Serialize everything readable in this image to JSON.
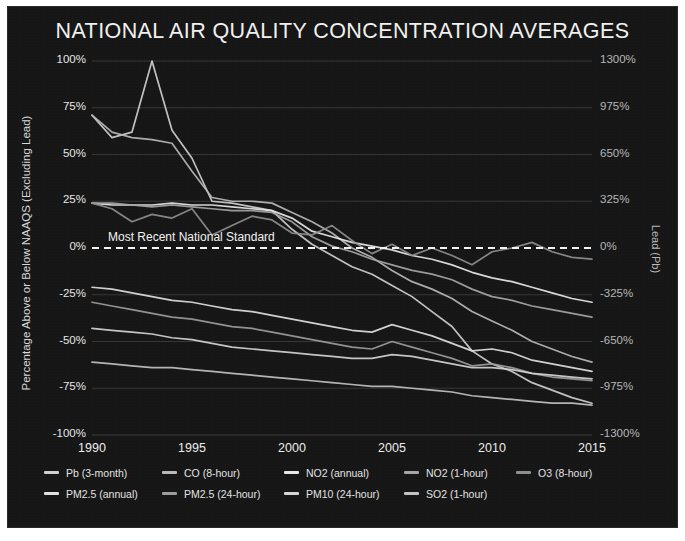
{
  "chart_card": {
    "background": "#161616",
    "border": "#ffffff"
  },
  "header": {
    "title": "NATIONAL AIR QUALITY CONCENTRATION AVERAGES"
  },
  "annotations": {
    "standard_line_label": "Most Recent National Standard"
  },
  "chart_data": {
    "type": "line",
    "title": "NATIONAL AIR QUALITY CONCENTRATION AVERAGES",
    "xlabel": "",
    "ylabel": "Percentage Above or Below NAAQS (Excluding Lead)",
    "y2label": "Lead (Pb)",
    "xlim": [
      1990,
      2015
    ],
    "ylim": [
      -100,
      100
    ],
    "y2lim": [
      -1300,
      1300
    ],
    "xticks": [
      1990,
      1995,
      2000,
      2005,
      2010,
      2015
    ],
    "xtick_labels": [
      "1990",
      "1995",
      "2000",
      "2005",
      "2010",
      "2015"
    ],
    "yticks": [
      100,
      75,
      50,
      25,
      0,
      -25,
      -50,
      -75,
      -100
    ],
    "ytick_labels": [
      "100%",
      "75%",
      "50%",
      "25%",
      "0%",
      "-25%",
      "-50%",
      "-75%",
      "-100%"
    ],
    "y2ticks": [
      1300,
      975,
      650,
      325,
      0,
      -325,
      -650,
      -975,
      -1300
    ],
    "y2tick_labels": [
      "1300%",
      "975%",
      "650%",
      "325%",
      "0%",
      "-325%",
      "-650%",
      "-975%",
      "-1300%"
    ],
    "grid": true,
    "grid_color": "#555555",
    "legend_position": "bottom",
    "reference_line": {
      "value": 0,
      "label": "Most Recent National Standard",
      "style": "dashed",
      "color": "#f2f2f2"
    },
    "x": [
      1990,
      1991,
      1992,
      1993,
      1994,
      1995,
      1996,
      1997,
      1998,
      1999,
      2000,
      2001,
      2002,
      2003,
      2004,
      2005,
      2006,
      2007,
      2008,
      2009,
      2010,
      2011,
      2012,
      2013,
      2014,
      2015
    ],
    "series": [
      {
        "name": "Pb (3-month)",
        "axis": "right",
        "color": "#cfcfcf",
        "values": [
          71,
          59,
          62,
          100,
          63,
          48,
          25,
          24,
          22,
          20,
          10,
          2,
          -4,
          -10,
          -14,
          -20,
          -26,
          -34,
          -42,
          -55,
          -62,
          -66,
          -72,
          -76,
          -80,
          -83
        ]
      },
      {
        "name": "CO (8-hour)",
        "axis": "left",
        "color": "#b9b9b9",
        "values": [
          71,
          62,
          59,
          58,
          56,
          41,
          27,
          25,
          25,
          24,
          19,
          14,
          8,
          0,
          -5,
          -12,
          -18,
          -22,
          -27,
          -34,
          -39,
          -44,
          -50,
          -54,
          -58,
          -61
        ]
      },
      {
        "name": "NO2 (annual)",
        "axis": "left",
        "color": "#e8e8e8",
        "values": [
          24,
          23,
          23,
          23,
          24,
          23,
          23,
          22,
          21,
          20,
          16,
          9,
          6,
          3,
          1,
          -1,
          -4,
          -6,
          -9,
          -13,
          -16,
          -18,
          -21,
          -24,
          -27,
          -29
        ]
      },
      {
        "name": "NO2 (1-hour)",
        "axis": "left",
        "color": "#a6a6a6",
        "values": [
          24,
          24,
          23,
          22,
          23,
          22,
          21,
          20,
          20,
          19,
          14,
          6,
          1,
          -2,
          -6,
          -9,
          -12,
          -14,
          -17,
          -22,
          -26,
          -28,
          -31,
          -33,
          -35,
          -37
        ]
      },
      {
        "name": "O3 (8-hour)",
        "axis": "left",
        "color": "#8f8f8f",
        "values": [
          24,
          21,
          14,
          18,
          16,
          21,
          7,
          12,
          17,
          15,
          8,
          7,
          12,
          4,
          -3,
          2,
          -4,
          0,
          -4,
          -9,
          -2,
          0,
          3,
          -2,
          -5,
          -6
        ]
      },
      {
        "name": "PM2.5 (annual)",
        "axis": "left",
        "color": "#e0e0e0",
        "values": [
          -21,
          -22,
          -24,
          -26,
          -28,
          -29,
          -31,
          -33,
          -34,
          -36,
          -38,
          -40,
          -42,
          -44,
          -45,
          -41,
          -44,
          -47,
          -51,
          -55,
          -54,
          -56,
          -60,
          -62,
          -64,
          -66
        ]
      },
      {
        "name": "PM2.5 (24-hour)",
        "axis": "left",
        "color": "#9c9c9c",
        "values": [
          -29,
          -31,
          -33,
          -35,
          -37,
          -38,
          -40,
          -42,
          -43,
          -45,
          -47,
          -49,
          -51,
          -53,
          -54,
          -50,
          -53,
          -56,
          -59,
          -63,
          -62,
          -64,
          -67,
          -69,
          -70,
          -71
        ]
      },
      {
        "name": "PM10 (24-hour)",
        "axis": "left",
        "color": "#d4d4d4",
        "values": [
          -43,
          -44,
          -45,
          -46,
          -48,
          -49,
          -51,
          -53,
          -54,
          -55,
          -56,
          -57,
          -58,
          -59,
          -59,
          -57,
          -58,
          -60,
          -62,
          -64,
          -64,
          -65,
          -67,
          -68,
          -69,
          -70
        ]
      },
      {
        "name": "SO2 (1-hour)",
        "axis": "left",
        "color": "#c2c2c2",
        "values": [
          -61,
          -62,
          -63,
          -64,
          -64,
          -65,
          -66,
          -67,
          -68,
          -69,
          -70,
          -71,
          -72,
          -73,
          -74,
          -74,
          -75,
          -76,
          -77,
          -79,
          -80,
          -81,
          -82,
          -83,
          -83,
          -84
        ]
      }
    ]
  },
  "legend": {
    "items": [
      {
        "label": "Pb (3-month)",
        "color": "#cfcfcf"
      },
      {
        "label": "CO (8-hour)",
        "color": "#b9b9b9"
      },
      {
        "label": "NO2 (annual)",
        "color": "#e8e8e8"
      },
      {
        "label": "NO2 (1-hour)",
        "color": "#a6a6a6"
      },
      {
        "label": "O3 (8-hour)",
        "color": "#8f8f8f"
      },
      {
        "label": "PM2.5 (annual)",
        "color": "#e0e0e0"
      },
      {
        "label": "PM2.5 (24-hour)",
        "color": "#9c9c9c"
      },
      {
        "label": "PM10 (24-hour)",
        "color": "#d4d4d4"
      },
      {
        "label": "SO2 (1-hour)",
        "color": "#c2c2c2"
      }
    ]
  }
}
